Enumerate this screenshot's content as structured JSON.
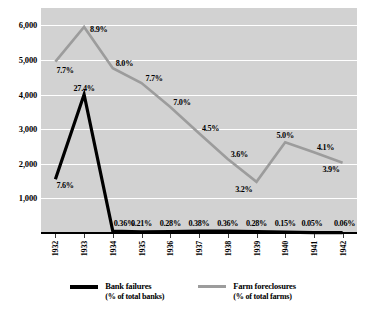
{
  "chart_data": {
    "type": "line",
    "title": "",
    "xlabel": "",
    "ylabel": "",
    "categories": [
      "1932",
      "1933",
      "1934",
      "1935",
      "1936",
      "1937",
      "1938",
      "1939",
      "1940",
      "1941",
      "1942"
    ],
    "ylim": [
      0,
      6500
    ],
    "yticks": [
      1000,
      2000,
      3000,
      4000,
      5000,
      6000
    ],
    "ytick_labels": [
      "1,000",
      "2,000",
      "3,000",
      "4,000",
      "5,000",
      "6,000"
    ],
    "grid": true,
    "legend_position": "bottom",
    "series": [
      {
        "name": "Bank failures",
        "sublabel": "(% of total banks)",
        "color": "#000000",
        "values": [
          1550,
          4000,
          55,
          32,
          42,
          58,
          55,
          42,
          23,
          8,
          9
        ],
        "point_labels": [
          "7.6%",
          "27.4%",
          "0.36%",
          "0.21%",
          "0.28%",
          "0.38%",
          "0.36%",
          "0.28%",
          "0.15%",
          "0.05%",
          "0.06%"
        ]
      },
      {
        "name": "Farm foreclosures",
        "sublabel": "(% of total farms)",
        "color": "#9c9c9c",
        "values": [
          4950,
          5950,
          4760,
          4330,
          3640,
          2880,
          2140,
          1480,
          2620,
          2330,
          2030
        ],
        "point_labels": [
          "7.7%",
          "8.9%",
          "8.0%",
          "7.7%",
          "7.0%",
          "4.5%",
          "3.6%",
          "3.2%",
          "5.0%",
          "4.1%",
          "3.9%"
        ]
      }
    ]
  },
  "axis": {
    "y_labels": [
      "6,000",
      "5,000",
      "4,000",
      "3,000",
      "2,000",
      "1,000"
    ],
    "x_labels": [
      "1932",
      "1933",
      "1934",
      "1935",
      "1936",
      "1937",
      "1938",
      "1939",
      "1940",
      "1941",
      "1942"
    ]
  },
  "legend": {
    "items": [
      {
        "label": "Bank failures",
        "sublabel": "(% of total banks)",
        "color": "#000000"
      },
      {
        "label": "Farm foreclosures",
        "sublabel": "(% of total farms)",
        "color": "#9c9c9c"
      }
    ]
  },
  "data_labels": {
    "bank": [
      "7.6%",
      "27.4%",
      "0.36%",
      "0.21%",
      "0.28%",
      "0.38%",
      "0.36%",
      "0.28%",
      "0.15%",
      "0.05%",
      "0.06%"
    ],
    "farm": [
      "7.7%",
      "8.9%",
      "8.0%",
      "7.7%",
      "7.0%",
      "4.5%",
      "3.6%",
      "3.2%",
      "5.0%",
      "4.1%",
      "3.9%"
    ]
  },
  "colors": {
    "plot_background": "#d2d2d2",
    "gridline": "#ffffff",
    "bank_series": "#000000",
    "farm_series": "#9c9c9c",
    "axis": "#000000"
  }
}
